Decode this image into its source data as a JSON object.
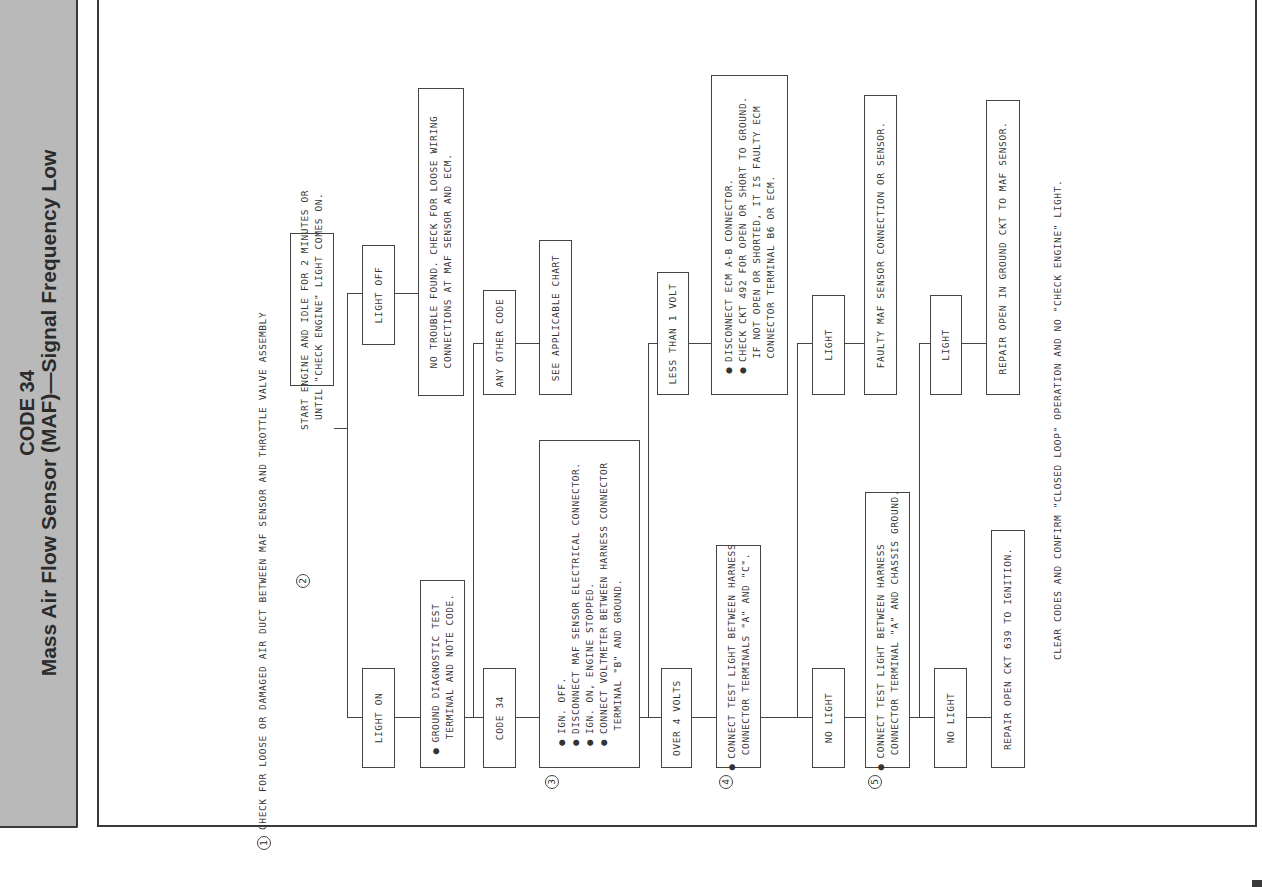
{
  "sidebar": {
    "code_title": "CODE 34",
    "subtitle": "Mass Air Flow Sensor (MAF)—Signal Frequency Low",
    "background_color": "#b9b9b9"
  },
  "flowchart": {
    "step1": {
      "number": "1",
      "text": "CHECK FOR LOOSE OR DAMAGED AIR DUCT BETWEEN MAF SENSOR AND THROTTLE VALVE ASSEMBLY"
    },
    "step2": {
      "number": "2",
      "lines": [
        "START ENGINE AND IDLE FOR 2 MINUTES OR",
        "UNTIL \"CHECK ENGINE\" LIGHT COMES ON."
      ]
    },
    "light_on": "LIGHT ON",
    "light_off": "LIGHT OFF",
    "ground_diag": {
      "lines": [
        "GROUND DIAGNOSTIC TEST",
        "TERMINAL AND NOTE CODE."
      ]
    },
    "no_trouble": {
      "lines": [
        "NO TROUBLE FOUND. CHECK FOR LOOSE WIRING",
        "CONNECTIONS AT MAF SENSOR AND ECM."
      ]
    },
    "code34": "CODE 34",
    "any_other_code": "ANY OTHER CODE",
    "see_chart": "SEE APPLICABLE CHART",
    "step3": {
      "number": "3",
      "lines": [
        "IGN. OFF.",
        "DISCONNECT MAF SENSOR ELECTRICAL CONNECTOR.",
        "IGN. ON, ENGINE STOPPED.",
        "CONNECT VOLTMETER BETWEEN HARNESS CONNECTOR",
        "TERMINAL \"B\" AND GROUND."
      ]
    },
    "over4": "OVER 4 VOLTS",
    "less1": "LESS THAN 1 VOLT",
    "ecm_box": {
      "lines": [
        "DISCONNECT ECM A-B CONNECTOR.",
        "CHECK CKT 492 FOR OPEN OR SHORT TO GROUND.",
        "IF NOT OPEN OR SHORTED, IT IS FAULTY ECM",
        "CONNECTOR TERMINAL B6 OR ECM."
      ]
    },
    "step4": {
      "number": "4",
      "lines": [
        "CONNECT TEST LIGHT BETWEEN HARNESS",
        "CONNECTOR TERMINALS \"A\" AND \"C\"."
      ]
    },
    "step4_no_light": "NO LIGHT",
    "step4_light": "LIGHT",
    "faulty_maf": "FAULTY MAF SENSOR CONNECTION OR SENSOR.",
    "step5": {
      "number": "5",
      "lines": [
        "CONNECT TEST LIGHT BETWEEN HARNESS",
        "CONNECTOR TERMINAL \"A\" AND CHASSIS GROUND."
      ]
    },
    "step5_no_light": "NO LIGHT",
    "step5_light": "LIGHT",
    "repair_639": "REPAIR OPEN CKT 639 TO IGNITION.",
    "repair_ground": "REPAIR OPEN IN GROUND CKT TO MAF SENSOR.",
    "footer": "CLEAR CODES AND CONFIRM \"CLOSED LOOP\" OPERATION AND NO \"CHECK ENGINE\" LIGHT."
  }
}
